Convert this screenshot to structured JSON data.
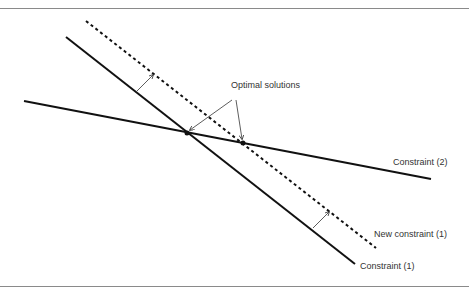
{
  "diagram": {
    "title": "",
    "labels": {
      "optimal": "Optimal solutions",
      "constraint2": "Constraint (2)",
      "new_constraint1": "New constraint (1)",
      "constraint1": "Constraint (1)"
    },
    "colors": {
      "line": "#111111",
      "arrow": "#333333",
      "rule": "#8a8a8a",
      "text": "#333333"
    },
    "lines": {
      "constraint1": {
        "x1": 66,
        "y1": 37,
        "x2": 355,
        "y2": 264,
        "style": "solid"
      },
      "new_constraint1": {
        "x1": 86,
        "y1": 21,
        "x2": 376,
        "y2": 248,
        "style": "dashed"
      },
      "constraint2": {
        "x1": 24,
        "y1": 101,
        "x2": 431,
        "y2": 179,
        "style": "solid"
      }
    },
    "points": [
      {
        "name": "optimal-1",
        "x": 187,
        "y": 133
      },
      {
        "name": "optimal-2",
        "x": 243,
        "y": 143
      }
    ]
  }
}
